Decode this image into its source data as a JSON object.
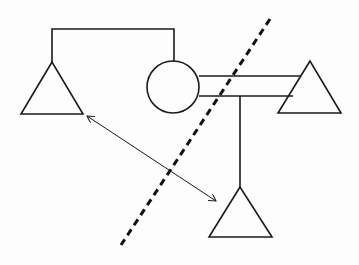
{
  "diagram": {
    "type": "genogram",
    "colors": {
      "stroke": "#1a1a1a",
      "background": "#fdfdfd",
      "dashed_line": "#111111"
    },
    "nodes": [
      {
        "id": "left-triangle",
        "shape": "triangle",
        "apex": [
          52,
          62
        ],
        "base_left": [
          21,
          114
        ],
        "base_right": [
          83,
          114
        ]
      },
      {
        "id": "center-circle",
        "shape": "circle",
        "center": [
          173,
          87
        ],
        "radius": 26
      },
      {
        "id": "right-triangle",
        "shape": "triangle",
        "apex": [
          310,
          61
        ],
        "base_left": [
          278,
          113
        ],
        "base_right": [
          341,
          113
        ]
      },
      {
        "id": "bottom-triangle",
        "shape": "triangle",
        "apex": [
          240,
          187
        ],
        "base_left": [
          209,
          237
        ],
        "base_right": [
          272,
          237
        ]
      }
    ],
    "connections": [
      {
        "id": "top-bracket",
        "type": "relationship",
        "points": [
          [
            52,
            62
          ],
          [
            52,
            29
          ],
          [
            174,
            29
          ],
          [
            174,
            61
          ]
        ]
      },
      {
        "id": "upper-parallel-line",
        "type": "relationship",
        "from": [
          199,
          76
        ],
        "to": [
          301,
          76
        ]
      },
      {
        "id": "lower-parallel-line",
        "type": "relationship",
        "from": [
          199,
          96
        ],
        "to": [
          293,
          96
        ]
      },
      {
        "id": "child-line",
        "type": "descent",
        "from": [
          240,
          96
        ],
        "to": [
          240,
          187
        ]
      },
      {
        "id": "double-arrow",
        "type": "bidirectional",
        "from": [
          87,
          116
        ],
        "to": [
          216,
          201
        ]
      },
      {
        "id": "dashed-divider",
        "type": "boundary",
        "from": [
          270,
          19
        ],
        "to": [
          121,
          245
        ]
      }
    ]
  }
}
